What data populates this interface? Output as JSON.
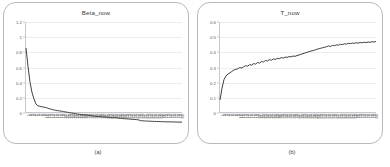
{
  "figure": {
    "panels": [
      {
        "caption": "(a)",
        "chart_ref": 0
      },
      {
        "caption": "(b)",
        "chart_ref": 1
      }
    ]
  },
  "chart_data": [
    {
      "type": "line",
      "title": "Beta_now",
      "xlabel": "",
      "ylabel": "",
      "ylim": [
        0,
        1.2
      ],
      "yticks": [
        0,
        0.2,
        0.4,
        0.6,
        0.8,
        1,
        1.2
      ],
      "ytick_labels": [
        "0",
        "0.2",
        "0.4",
        "0.6",
        "0.8",
        "1",
        "1.2"
      ],
      "grid": "horizontal",
      "legend": "none",
      "line_color": "#3f3f3f",
      "x": [
        1,
        2,
        3,
        4,
        5,
        6,
        7,
        8,
        9,
        10,
        11,
        12,
        13,
        14,
        15,
        16,
        17,
        18,
        19,
        20,
        21,
        22,
        23,
        24,
        25,
        26,
        27,
        28,
        29,
        30,
        31,
        32,
        33,
        34,
        35,
        36,
        37,
        38,
        39,
        40,
        41,
        42,
        43,
        44,
        45,
        46,
        47,
        48,
        49,
        50,
        51,
        52,
        53,
        54,
        55,
        56,
        57,
        58,
        59,
        60,
        61,
        62,
        63,
        64,
        65,
        66,
        67,
        68,
        69,
        70,
        71,
        72,
        73,
        74,
        75,
        76,
        77,
        78,
        79,
        80
      ],
      "xtick_labels": [
        "1",
        "2",
        "3",
        "4",
        "5",
        "6",
        "7",
        "8",
        "9",
        "10",
        "11",
        "12",
        "13",
        "14",
        "15",
        "16",
        "17",
        "18",
        "19",
        "20",
        "21",
        "22",
        "23",
        "24",
        "25",
        "26",
        "27",
        "28",
        "29",
        "30",
        "31",
        "32",
        "33",
        "34",
        "35",
        "36",
        "37",
        "38",
        "39",
        "40",
        "41",
        "42",
        "43",
        "44",
        "45",
        "46",
        "47",
        "48",
        "49",
        "50",
        "51",
        "52",
        "53",
        "54",
        "55",
        "56",
        "57",
        "58",
        "59",
        "60",
        "61",
        "62",
        "63",
        "64",
        "65",
        "66",
        "67",
        "68",
        "69",
        "70",
        "71",
        "72",
        "73",
        "74",
        "75",
        "76",
        "77",
        "78",
        "79",
        "80"
      ],
      "values": [
        1.0,
        0.86,
        0.74,
        0.66,
        0.61,
        0.57,
        0.555,
        0.552,
        0.548,
        0.545,
        0.542,
        0.537,
        0.532,
        0.528,
        0.524,
        0.521,
        0.518,
        0.516,
        0.514,
        0.511,
        0.508,
        0.506,
        0.503,
        0.5,
        0.498,
        0.495,
        0.492,
        0.49,
        0.488,
        0.486,
        0.487,
        0.484,
        0.481,
        0.479,
        0.477,
        0.475,
        0.474,
        0.473,
        0.471,
        0.469,
        0.47,
        0.468,
        0.466,
        0.464,
        0.463,
        0.465,
        0.462,
        0.46,
        0.459,
        0.457,
        0.456,
        0.455,
        0.454,
        0.452,
        0.451,
        0.45,
        0.449,
        0.447,
        0.441,
        0.44,
        0.439,
        0.438,
        0.437,
        0.437,
        0.436,
        0.435,
        0.435,
        0.434,
        0.434,
        0.433,
        0.433,
        0.432,
        0.432,
        0.432,
        0.431,
        0.431,
        0.431,
        0.43,
        0.43,
        0.43
      ]
    },
    {
      "type": "line",
      "title": "T_now",
      "xlabel": "",
      "ylabel": "",
      "ylim": [
        0,
        0.6
      ],
      "yticks": [
        0,
        0.1,
        0.2,
        0.3,
        0.4,
        0.5,
        0.6
      ],
      "ytick_labels": [
        "0",
        "0.1",
        "0.2",
        "0.3",
        "0.4",
        "0.5",
        "0.6"
      ],
      "grid": "horizontal",
      "legend": "none",
      "line_color": "#3f3f3f",
      "x": [
        1,
        2,
        3,
        4,
        5,
        6,
        7,
        8,
        9,
        10,
        11,
        12,
        13,
        14,
        15,
        16,
        17,
        18,
        19,
        20,
        21,
        22,
        23,
        24,
        25,
        26,
        27,
        28,
        29,
        30,
        31,
        32,
        33,
        34,
        35,
        36,
        37,
        38,
        39,
        40,
        41,
        42,
        43,
        44,
        45,
        46,
        47,
        48,
        49,
        50,
        51,
        52,
        53,
        54,
        55,
        56,
        57,
        58,
        59,
        60,
        61,
        62,
        63,
        64,
        65,
        66,
        67,
        68,
        69,
        70,
        71,
        72,
        73,
        74,
        75,
        76,
        77,
        78,
        79,
        80
      ],
      "xtick_labels": [
        "1",
        "2",
        "3",
        "4",
        "5",
        "6",
        "7",
        "8",
        "9",
        "10",
        "11",
        "12",
        "13",
        "14",
        "15",
        "16",
        "17",
        "18",
        "19",
        "20",
        "21",
        "22",
        "23",
        "24",
        "25",
        "26",
        "27",
        "28",
        "29",
        "30",
        "31",
        "32",
        "33",
        "34",
        "35",
        "36",
        "37",
        "38",
        "39",
        "40",
        "41",
        "42",
        "43",
        "44",
        "45",
        "46",
        "47",
        "48",
        "49",
        "50",
        "51",
        "52",
        "53",
        "54",
        "55",
        "56",
        "57",
        "58",
        "59",
        "60",
        "61",
        "62",
        "63",
        "64",
        "65",
        "66",
        "67",
        "68",
        "69",
        "70",
        "71",
        "72",
        "73",
        "74",
        "75",
        "76",
        "77",
        "78",
        "79",
        "80"
      ],
      "values": [
        0.3,
        0.345,
        0.378,
        0.392,
        0.4,
        0.404,
        0.41,
        0.415,
        0.418,
        0.42,
        0.425,
        0.423,
        0.428,
        0.432,
        0.43,
        0.436,
        0.434,
        0.44,
        0.438,
        0.444,
        0.442,
        0.448,
        0.446,
        0.452,
        0.45,
        0.455,
        0.453,
        0.458,
        0.456,
        0.46,
        0.459,
        0.463,
        0.461,
        0.465,
        0.464,
        0.467,
        0.466,
        0.469,
        0.468,
        0.471,
        0.473,
        0.476,
        0.478,
        0.481,
        0.483,
        0.486,
        0.488,
        0.49,
        0.492,
        0.495,
        0.497,
        0.499,
        0.501,
        0.503,
        0.505,
        0.508,
        0.506,
        0.51,
        0.509,
        0.512,
        0.511,
        0.514,
        0.513,
        0.516,
        0.515,
        0.518,
        0.517,
        0.519,
        0.518,
        0.52,
        0.519,
        0.521,
        0.52,
        0.522,
        0.521,
        0.523,
        0.522,
        0.524,
        0.523,
        0.525
      ]
    }
  ]
}
